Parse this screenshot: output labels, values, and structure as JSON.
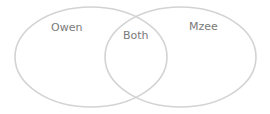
{
  "diagram": {
    "type": "venn",
    "stroke_color": "#d3d3d3",
    "text_color": "#7a7a7a",
    "sets": [
      {
        "id": "left",
        "label": "Owen"
      },
      {
        "id": "right",
        "label": "Mzee"
      }
    ],
    "intersection": {
      "label": "Both"
    }
  }
}
